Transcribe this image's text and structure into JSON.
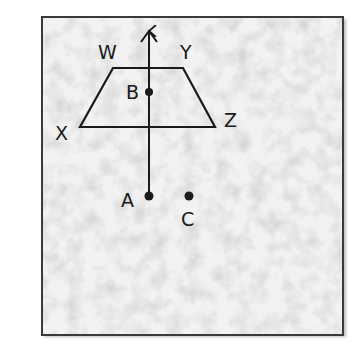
{
  "diagram": {
    "type": "geometry-figure",
    "colors": {
      "stroke": "#1a1a1a",
      "paper": "#f2f2f2",
      "frame": "#3a3a3a"
    },
    "shapes": {
      "trapezoid": {
        "vertices": [
          "W",
          "Y",
          "Z",
          "X"
        ]
      },
      "arrow": {
        "from": "A",
        "through": "B",
        "direction": "up"
      }
    },
    "labels": {
      "W": "W",
      "Y": "Y",
      "X": "X",
      "Z": "Z",
      "B": "B",
      "A": "A",
      "C": "C"
    },
    "points": [
      "A",
      "B",
      "C"
    ]
  }
}
